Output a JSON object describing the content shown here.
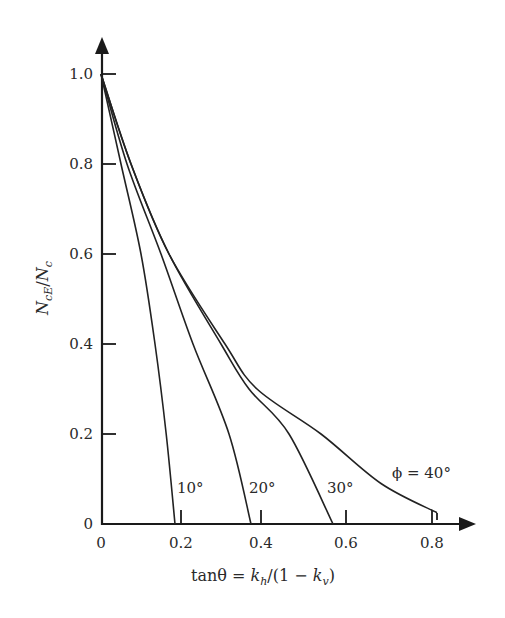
{
  "chart_data": {
    "type": "line",
    "title": "",
    "xlabel": "tanθ = k_h/(1 − k_v)",
    "ylabel": "N_cE/N_c",
    "xlim": [
      0,
      0.85
    ],
    "ylim": [
      0,
      1.05
    ],
    "x_ticks": [
      "0",
      "0.2",
      "0.4",
      "0.6",
      "0.8"
    ],
    "y_ticks": [
      "0",
      "0.2",
      "0.4",
      "0.6",
      "0.8",
      "1.0"
    ],
    "grid": false,
    "legend": "inline curve labels",
    "series": [
      {
        "name": "φ = 10°",
        "label": "10°",
        "points": [
          [
            0,
            1.0
          ],
          [
            0.05,
            0.8
          ],
          [
            0.1,
            0.6
          ],
          [
            0.135,
            0.4
          ],
          [
            0.163,
            0.2
          ],
          [
            0.185,
            0.0
          ]
        ]
      },
      {
        "name": "φ = 20°",
        "label": "20°",
        "points": [
          [
            0,
            1.0
          ],
          [
            0.065,
            0.8
          ],
          [
            0.15,
            0.6
          ],
          [
            0.23,
            0.4
          ],
          [
            0.32,
            0.2
          ],
          [
            0.375,
            0.0
          ]
        ]
      },
      {
        "name": "φ = 30°",
        "label": "30°",
        "points": [
          [
            0,
            1.0
          ],
          [
            0.075,
            0.8
          ],
          [
            0.17,
            0.6
          ],
          [
            0.3,
            0.4
          ],
          [
            0.37,
            0.3
          ],
          [
            0.47,
            0.2
          ],
          [
            0.58,
            0.0
          ]
        ]
      },
      {
        "name": "φ = 40°",
        "label": "ϕ = 40°",
        "points": [
          [
            0,
            1.0
          ],
          [
            0.075,
            0.8
          ],
          [
            0.17,
            0.6
          ],
          [
            0.31,
            0.4
          ],
          [
            0.39,
            0.3
          ],
          [
            0.55,
            0.2
          ],
          [
            0.7,
            0.09
          ],
          [
            0.84,
            0.025
          ]
        ]
      }
    ]
  },
  "axes": {
    "x_ticks": [
      {
        "value": 0,
        "label": "0"
      },
      {
        "value": 0.2,
        "label": "0.2"
      },
      {
        "value": 0.4,
        "label": "0.4"
      },
      {
        "value": 0.6,
        "label": "0.6"
      },
      {
        "value": 0.8,
        "label": "0.8"
      }
    ],
    "y_ticks": [
      {
        "value": 0,
        "label": "0"
      },
      {
        "value": 0.2,
        "label": "0.2"
      },
      {
        "value": 0.4,
        "label": "0.4"
      },
      {
        "value": 0.6,
        "label": "0.6"
      },
      {
        "value": 0.8,
        "label": "0.8"
      },
      {
        "value": 1.0,
        "label": "1.0"
      }
    ],
    "x_title": {
      "prefix": "tanθ = ",
      "k": "k",
      "h": "h",
      "mid": "/(1 − ",
      "k2": "k",
      "v": "v",
      "suffix": ")"
    },
    "y_title": {
      "n1": "N",
      "sub1": "cE",
      "slash": "/",
      "n2": "N",
      "sub2": "c"
    }
  },
  "curve_labels": {
    "c10": "10°",
    "c20": "20°",
    "c30": "30°",
    "c40": "ϕ = 40°"
  }
}
